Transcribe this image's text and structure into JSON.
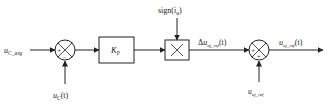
{
  "diagram": {
    "type": "control-block-diagram",
    "inputs": {
      "u_c_avg": {
        "base": "u",
        "sub": "C_avg"
      },
      "u_c_t": {
        "base": "u",
        "sub": "C",
        "suffix": "(t)"
      },
      "sign_iu": {
        "prefix": "sign(",
        "base": "i",
        "sub": "u",
        "suffix": ")"
      },
      "u_uj_ref": {
        "base": "u",
        "sub": "uj_ref"
      }
    },
    "blocks": {
      "sum1": {
        "signs": [
          "+",
          "−"
        ]
      },
      "gain": {
        "base": "K",
        "sub": "P"
      },
      "multiplier": {
        "symbol": "×"
      },
      "sum2": {
        "signs": [
          "+",
          "+"
        ]
      }
    },
    "signals": {
      "delta_u": {
        "prefix": "Δ",
        "base": "u",
        "sub": "uj_ref",
        "suffix": "(t)"
      },
      "output": {
        "base": "u",
        "sub": "uj_ref",
        "suffix": "(t)"
      }
    }
  }
}
